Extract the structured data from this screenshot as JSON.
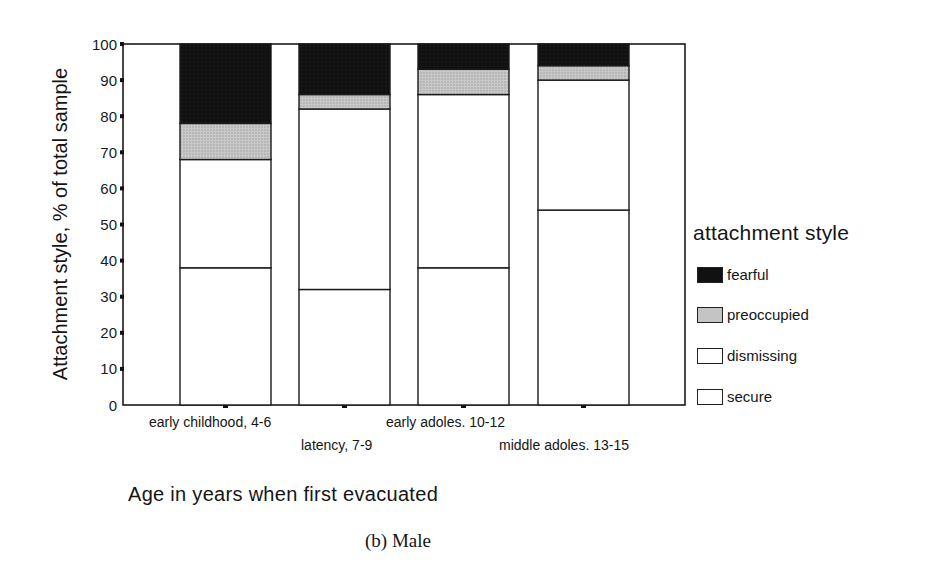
{
  "chart_data": {
    "type": "bar",
    "stacked": true,
    "title": "",
    "caption": "(b) Male",
    "xlabel": "Age in years when first evacuated",
    "ylabel": "Attachment style, % of total sample",
    "ylim": [
      0,
      100
    ],
    "yticks": [
      0,
      10,
      20,
      30,
      40,
      50,
      60,
      70,
      80,
      90,
      100
    ],
    "grid": false,
    "legend_position": "right",
    "legend_title": "attachment style",
    "categories": [
      "early childhood, 4-6",
      "latency, 7-9",
      "early adoles. 10-12",
      "middle adoles. 13-15"
    ],
    "series": [
      {
        "name": "secure",
        "values": [
          38,
          32,
          38,
          54
        ],
        "color": "#ffffff"
      },
      {
        "name": "dismissing",
        "values": [
          30,
          50,
          48,
          36
        ],
        "color": "#ffffff"
      },
      {
        "name": "preoccupied",
        "values": [
          10,
          4,
          7,
          4
        ],
        "color": "#c4c4c4"
      },
      {
        "name": "fearful",
        "values": [
          22,
          14,
          7,
          6
        ],
        "color": "#111111"
      }
    ],
    "legend_order": [
      "fearful",
      "preoccupied",
      "dismissing",
      "secure"
    ]
  },
  "labels": {
    "ylabel": "Attachment style, % of total sample",
    "xlabel": "Age in years when first evacuated",
    "caption": "(b) Male",
    "legend_title": "attachment style",
    "legend": [
      "fearful",
      "preoccupied",
      "dismissing",
      "secure"
    ],
    "categories": [
      "early childhood, 4-6",
      "latency, 7-9",
      "early adoles. 10-12",
      "middle adoles. 13-15"
    ]
  }
}
